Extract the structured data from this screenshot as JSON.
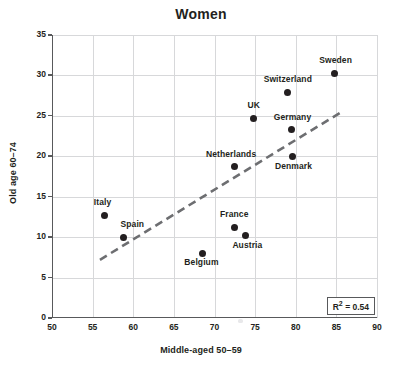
{
  "chart_data": {
    "type": "scatter",
    "title": "Women",
    "xlabel": "Middle-aged 50–59",
    "ylabel": "Old age 60–74",
    "xlim": [
      50,
      90
    ],
    "ylim": [
      0,
      35
    ],
    "xticks": [
      50,
      55,
      60,
      65,
      70,
      75,
      80,
      85,
      90
    ],
    "yticks": [
      0,
      5,
      10,
      15,
      20,
      25,
      30,
      35
    ],
    "grid": true,
    "legend": "none",
    "marker_color": "#231f20",
    "trendline_color": "#6d6e71",
    "points": [
      {
        "label": "Italy",
        "x": 56.5,
        "y": 12.7,
        "label_dx": -2,
        "label_dy": -14
      },
      {
        "label": "Spain",
        "x": 58.8,
        "y": 10.0,
        "label_dx": 9,
        "label_dy": -14
      },
      {
        "label": "Belgium",
        "x": 68.5,
        "y": 8.0,
        "label_dx": -1,
        "label_dy": 8
      },
      {
        "label": "France",
        "x": 72.4,
        "y": 11.2,
        "label_dx": 0,
        "label_dy": -14
      },
      {
        "label": "Austria",
        "x": 73.8,
        "y": 10.2,
        "label_dx": 2,
        "label_dy": 8
      },
      {
        "label": "Netherlands",
        "x": 72.4,
        "y": 18.7,
        "label_dx": -3,
        "label_dy": -14
      },
      {
        "label": "UK",
        "x": 74.8,
        "y": 24.7,
        "label_dx": 0,
        "label_dy": -14
      },
      {
        "label": "Germany",
        "x": 79.5,
        "y": 23.3,
        "label_dx": 1,
        "label_dy": -14
      },
      {
        "label": "Denmark",
        "x": 79.6,
        "y": 20.0,
        "label_dx": 1,
        "label_dy": 9
      },
      {
        "label": "Switzerland",
        "x": 79.0,
        "y": 27.9,
        "label_dx": 0,
        "label_dy": -14
      },
      {
        "label": "Sweden",
        "x": 84.8,
        "y": 30.3,
        "label_dx": 1,
        "label_dy": -14
      }
    ],
    "trendline": {
      "x0": 55.9,
      "y0": 7.2,
      "x1": 85.5,
      "y1": 25.4
    },
    "annotation": {
      "r2_prefix": "R",
      "r2_sup": "2",
      "r2_value": " = 0.54"
    }
  }
}
